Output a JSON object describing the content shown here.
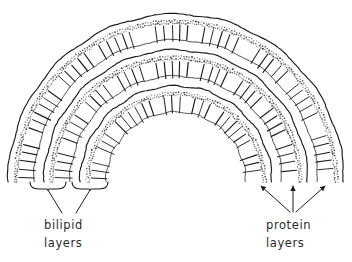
{
  "figure": {
    "kind": "scientific-line-diagram",
    "background_color": "#ffffff",
    "ink_color": "#1d1d1d",
    "stipple_color": "#3a3a3a",
    "width": 352,
    "height": 262
  },
  "geometry": {
    "center_x": 176,
    "center_y": 182,
    "start_angle_deg": 180,
    "end_angle_deg": 360,
    "bands": [
      {
        "id": "band-outer",
        "solid_radius": 168,
        "stipple_radius": 159,
        "tick_inner_radius": 157,
        "tick_outer_radius": 141,
        "tick_count": 58
      },
      {
        "id": "band-middle",
        "solid_radius": 132,
        "stipple_radius": 123,
        "tick_inner_radius": 121,
        "tick_outer_radius": 105,
        "tick_count": 46
      },
      {
        "id": "band-inner",
        "solid_radius": 96,
        "stipple_radius": 87,
        "tick_inner_radius": 85,
        "tick_outer_radius": 69,
        "tick_count": 34
      }
    ],
    "tick_gap_groups": 9
  },
  "annotations": {
    "left": {
      "label_line_1": "bilipid",
      "label_line_2": "layers",
      "label_x": 44,
      "label_y_1": 229,
      "label_y_2": 247,
      "braces": [
        {
          "id": "brace-1",
          "x_start": 30,
          "x_end": 66,
          "y": 182
        },
        {
          "id": "brace-2",
          "x_start": 72,
          "x_end": 108,
          "y": 182
        }
      ],
      "leaders": [
        {
          "from_x": 48,
          "from_y": 190,
          "to_x": 62,
          "to_y": 213
        },
        {
          "from_x": 90,
          "from_y": 190,
          "to_x": 76,
          "to_y": 213
        }
      ]
    },
    "right": {
      "label_line_1": "protein",
      "label_line_2": "layers",
      "label_x": 266,
      "label_y_1": 229,
      "label_y_2": 247,
      "arrows": [
        {
          "id": "arrow-left",
          "from_x": 290,
          "from_y": 212,
          "to_x": 261,
          "to_y": 186
        },
        {
          "id": "arrow-center",
          "from_x": 293,
          "from_y": 212,
          "to_x": 293,
          "to_y": 186
        },
        {
          "id": "arrow-right",
          "from_x": 296,
          "from_y": 212,
          "to_x": 325,
          "to_y": 186
        }
      ]
    }
  }
}
